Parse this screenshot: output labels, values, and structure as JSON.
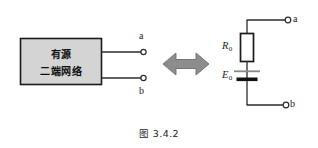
{
  "figure": {
    "caption": "图 3.4.2",
    "background_color": "#ffffff",
    "line_color": "#2b2b2b"
  },
  "left_block": {
    "box": {
      "label_line1": "有源",
      "label_line2": "二端网络",
      "fill_color": "#d4d4d4",
      "border_color": "#1a1a1a"
    },
    "terminals": [
      {
        "id": "terminal-a",
        "label": "a",
        "position": "top"
      },
      {
        "id": "terminal-b",
        "label": "b",
        "position": "bottom"
      }
    ]
  },
  "equivalence_arrow": {
    "name": "double-headed-arrow",
    "direction": "left-right",
    "fill_color": "#8c8c8c",
    "border_color": "#6e6e6e"
  },
  "right_circuit": {
    "components": [
      {
        "id": "resistor",
        "symbol": "rectangle-resistor",
        "label": "R",
        "subscript": "0",
        "fill_color": "#ffffff",
        "border_color": "#1a1a1a"
      },
      {
        "id": "voltage-source",
        "symbol": "battery-cell",
        "label": "E",
        "subscript": "0",
        "long_plate_color": "#8a8a8a",
        "short_plate_color": "#111111"
      }
    ],
    "terminals": [
      {
        "id": "terminal-a",
        "label": "a",
        "position": "top"
      },
      {
        "id": "terminal-b",
        "label": "b",
        "position": "bottom"
      }
    ]
  }
}
